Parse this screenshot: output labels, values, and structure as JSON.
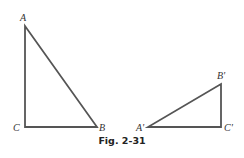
{
  "figure": {
    "caption": "Fig. 2-31",
    "triangles": [
      {
        "name": "triangle-ABC",
        "vertices": [
          {
            "label": "A",
            "role": "top"
          },
          {
            "label": "C",
            "role": "right-angle"
          },
          {
            "label": "B",
            "role": "bottom-right"
          }
        ]
      },
      {
        "name": "triangle-A'B'C'",
        "vertices": [
          {
            "label": "A'",
            "role": "bottom-left"
          },
          {
            "label": "C'",
            "role": "right-angle"
          },
          {
            "label": "B'",
            "role": "top"
          }
        ]
      }
    ],
    "colors": {
      "stroke": "#555555",
      "text": "#333333"
    }
  }
}
